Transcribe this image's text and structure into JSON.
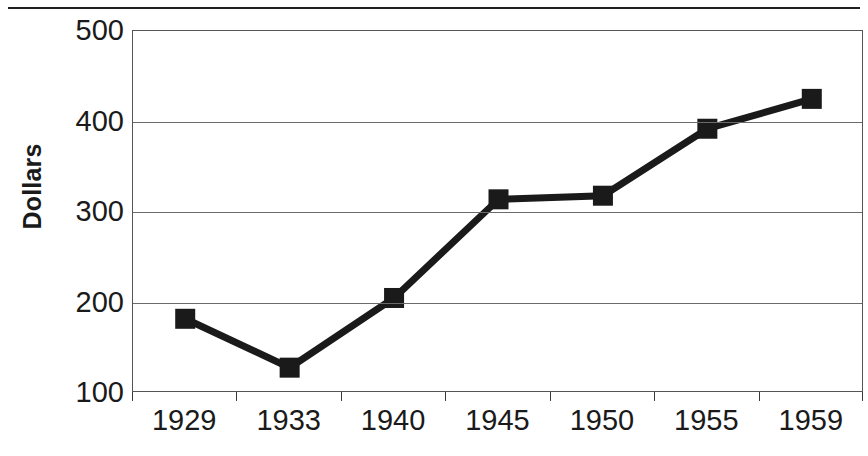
{
  "chart_data": {
    "type": "line",
    "title": "",
    "xlabel": "",
    "ylabel": "Dollars",
    "categories": [
      "1929",
      "1933",
      "1940",
      "1945",
      "1950",
      "1955",
      "1959"
    ],
    "values": [
      182,
      128,
      205,
      314,
      318,
      392,
      425
    ],
    "series": [
      {
        "name": "Dollars",
        "values": [
          182,
          128,
          205,
          314,
          318,
          392,
          425
        ]
      }
    ],
    "ylim": [
      100,
      500
    ],
    "yticks": [
      500,
      400,
      300,
      200,
      100
    ],
    "ytick_labels": [
      "500",
      "400",
      "300",
      "200",
      "100"
    ],
    "grid": "horizontal",
    "legend": "none",
    "marker": "square",
    "marker_color": "#1a1a1a",
    "line_color": "#1a1a1a",
    "line_width": 7,
    "axis_color": "#555555",
    "gridline_color": "#6b6b6b",
    "background": "#ffffff"
  },
  "axes": {
    "y_title": "Dollars"
  }
}
